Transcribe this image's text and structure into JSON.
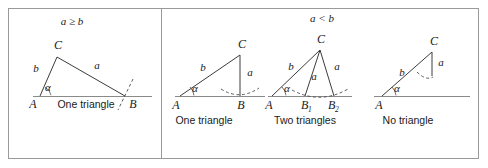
{
  "figure": {
    "background": "#ffffff",
    "line_color": "#3c3c3c",
    "baseline_color": "#8a8a8a",
    "frame_color": "#9a9a9a"
  },
  "sections": [
    {
      "id": "left",
      "condition": "a ≥ b",
      "panels": [
        {
          "id": "panel-1",
          "caption": "One triangle",
          "vertices": {
            "A": "A",
            "B": "B",
            "C": "C"
          },
          "sides": {
            "b": "b",
            "a": "a"
          },
          "angle": "α",
          "arc": true
        }
      ]
    },
    {
      "id": "right",
      "condition": "a < b",
      "panels": [
        {
          "id": "panel-2",
          "caption": "One triangle",
          "vertices": {
            "A": "A",
            "B": "B",
            "C": "C"
          },
          "sides": {
            "b": "b",
            "a": "a"
          },
          "angle": "α",
          "arc": true
        },
        {
          "id": "panel-3",
          "caption": "Two triangles",
          "vertices": {
            "A": "A",
            "B1": "B",
            "B1_sub": "1",
            "B2": "B",
            "B2_sub": "2",
            "C": "C"
          },
          "sides": {
            "b": "b",
            "a1": "a",
            "a2": "a"
          },
          "angle": "α",
          "arc": true
        },
        {
          "id": "panel-4",
          "caption": "No triangle",
          "vertices": {
            "A": "A",
            "C": "C"
          },
          "sides": {
            "b": "b",
            "a": "a"
          },
          "angle": "α",
          "arc": true
        }
      ]
    }
  ]
}
